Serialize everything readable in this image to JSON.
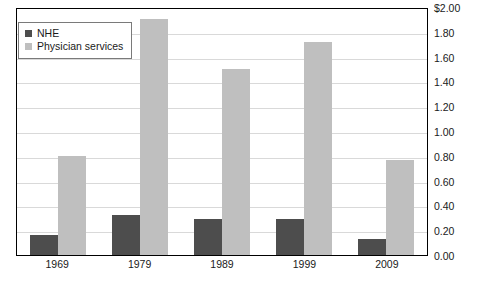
{
  "chart_data": {
    "type": "bar",
    "title": "",
    "subtitle": "",
    "xlabel": "",
    "ylabel": "",
    "categories": [
      "1969",
      "1979",
      "1989",
      "1999",
      "2009"
    ],
    "series": [
      {
        "name": "NHE",
        "color": "#4d4d4d",
        "values": [
          0.16,
          0.32,
          0.29,
          0.29,
          0.13
        ]
      },
      {
        "name": "Physician services",
        "color": "#bfbfbf",
        "values": [
          0.8,
          1.9,
          1.5,
          1.72,
          0.77
        ]
      }
    ],
    "ylim": [
      0.0,
      2.0
    ],
    "y_ticks": [
      0.0,
      0.2,
      0.4,
      0.6,
      0.8,
      1.0,
      1.2,
      1.4,
      1.6,
      1.8,
      2.0
    ],
    "y_tick_labels": [
      "0.00",
      "0.20",
      "0.40",
      "0.60",
      "0.80",
      "1.00",
      "1.20",
      "1.40",
      "1.60",
      "1.80",
      "$2.00"
    ],
    "y_axis_position": "right",
    "grid": true,
    "legend_position": "top-left"
  },
  "legend": {
    "items": [
      {
        "label": "NHE"
      },
      {
        "label": "Physician services"
      }
    ]
  },
  "colors": {
    "series_nhe": "#4d4d4d",
    "series_physician": "#bfbfbf",
    "gridline": "#d9d9d9",
    "frame": "#000000",
    "text": "#1a1a1a"
  }
}
